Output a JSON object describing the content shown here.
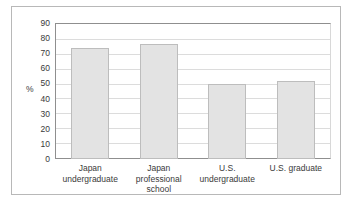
{
  "chart_data": {
    "type": "bar",
    "title": "",
    "xlabel": "",
    "ylabel": "%",
    "ylim": [
      0,
      90
    ],
    "y_ticks": [
      90,
      80,
      70,
      60,
      50,
      40,
      30,
      20,
      10,
      0
    ],
    "grid": true,
    "legend": "none",
    "categories": [
      "Japan undergraduate",
      "Japan professional school",
      "U.S. undergraduate",
      "U.S. graduate"
    ],
    "values": [
      74,
      77,
      50,
      52
    ],
    "bar_fill_color": "#e3e3e3",
    "bar_border_color": "#bdbdbd",
    "gridline_color": "#dcdcdc",
    "axis_color": "#8f8f8f",
    "frame_color": "#b8b8b8",
    "background_color": "#ffffff"
  }
}
